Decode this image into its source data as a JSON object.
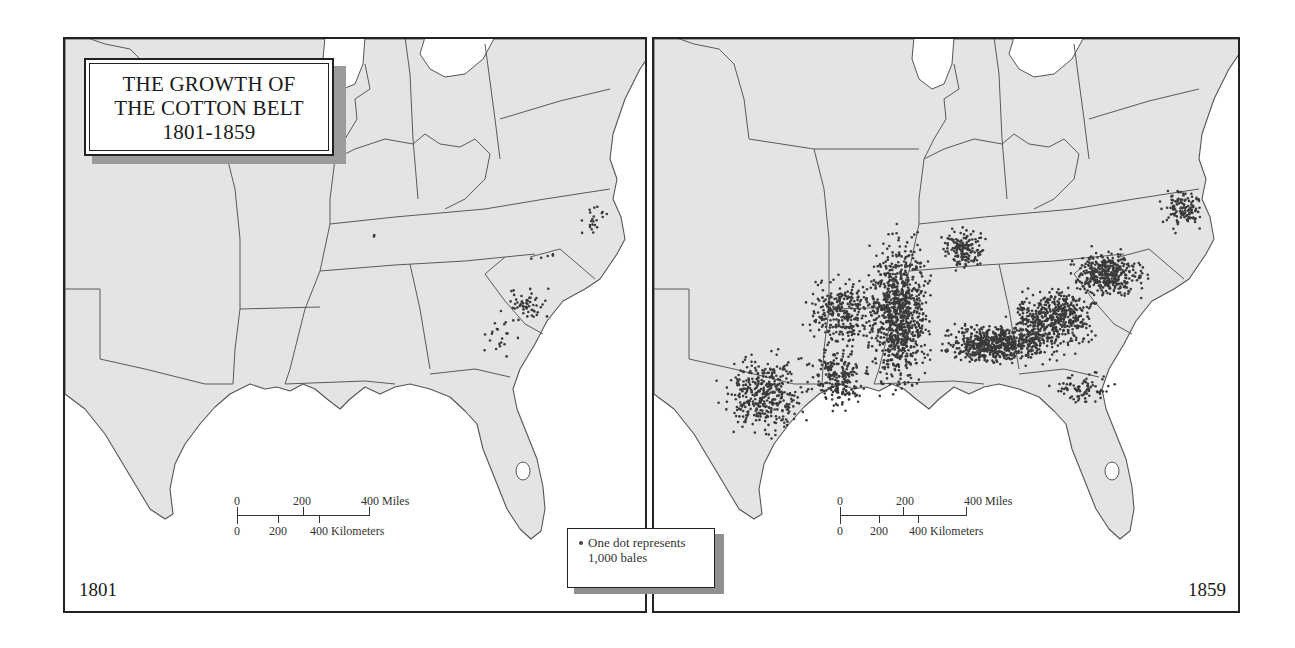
{
  "title": {
    "line1": "THE GROWTH OF",
    "line2": "THE COTTON BELT",
    "line3": "1801-1859"
  },
  "panels": [
    {
      "id": "left",
      "year": "1801",
      "scale": {
        "miles_labels": [
          "0",
          "200",
          "400 Miles"
        ],
        "km_labels": [
          "0",
          "200",
          "400 Kilometers"
        ]
      }
    },
    {
      "id": "right",
      "year": "1859",
      "scale": {
        "miles_labels": [
          "0",
          "200",
          "400 Miles"
        ],
        "km_labels": [
          "0",
          "200",
          "400 Kilometers"
        ]
      }
    }
  ],
  "legend": {
    "symbol": "dot",
    "line1": "One dot represents",
    "line2": "1,000 bales"
  },
  "colors": {
    "land": "#e4e4e4",
    "water": "#ffffff",
    "borders": "#555555",
    "dots": "#3a3a3a"
  },
  "dot_clusters": {
    "1801": [
      {
        "region": "South Carolina piedmont",
        "cx": 460,
        "cy": 265,
        "rx": 38,
        "ry": 22,
        "n": 55
      },
      {
        "region": "Georgia upcountry",
        "cx": 435,
        "cy": 300,
        "rx": 20,
        "ry": 25,
        "n": 20
      },
      {
        "region": "North Carolina / Virginia border",
        "cx": 530,
        "cy": 180,
        "rx": 20,
        "ry": 22,
        "n": 22
      },
      {
        "region": "North Carolina interior",
        "cx": 480,
        "cy": 215,
        "rx": 30,
        "ry": 6,
        "n": 5
      },
      {
        "region": "Tennessee",
        "cx": 309,
        "cy": 196,
        "rx": 3,
        "ry": 2,
        "n": 2
      }
    ],
    "1859": [
      {
        "region": "Mississippi River valley",
        "cx": 245,
        "cy": 275,
        "rx": 38,
        "ry": 95,
        "n": 900
      },
      {
        "region": "Alabama black belt",
        "cx": 345,
        "cy": 305,
        "rx": 70,
        "ry": 25,
        "n": 650
      },
      {
        "region": "Georgia",
        "cx": 400,
        "cy": 280,
        "rx": 55,
        "ry": 40,
        "n": 500
      },
      {
        "region": "South Carolina",
        "cx": 455,
        "cy": 235,
        "rx": 45,
        "ry": 30,
        "n": 380
      },
      {
        "region": "North Carolina",
        "cx": 530,
        "cy": 170,
        "rx": 28,
        "ry": 25,
        "n": 120
      },
      {
        "region": "Arkansas",
        "cx": 190,
        "cy": 275,
        "rx": 45,
        "ry": 45,
        "n": 300
      },
      {
        "region": "East Texas",
        "cx": 110,
        "cy": 355,
        "rx": 55,
        "ry": 50,
        "n": 380
      },
      {
        "region": "Louisiana",
        "cx": 185,
        "cy": 340,
        "rx": 35,
        "ry": 40,
        "n": 220
      },
      {
        "region": "Tennessee",
        "cx": 310,
        "cy": 210,
        "rx": 30,
        "ry": 25,
        "n": 160
      },
      {
        "region": "North Florida",
        "cx": 430,
        "cy": 350,
        "rx": 40,
        "ry": 20,
        "n": 80
      }
    ]
  }
}
